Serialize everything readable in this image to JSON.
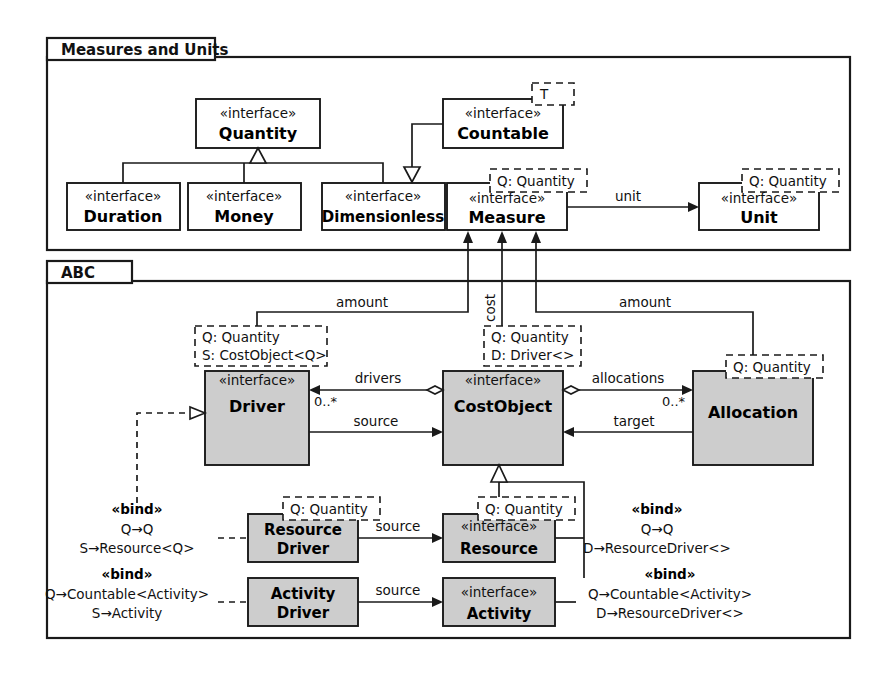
{
  "diagram": {
    "stereotype_interface": "«interface»",
    "stereotype_bind": "«bind»"
  },
  "packages": [
    {
      "id": "measures",
      "label": "Measures and Units"
    },
    {
      "id": "abc",
      "label": "ABC"
    }
  ],
  "classes": {
    "quantity": {
      "stereotype": "«interface»",
      "name": "Quantity",
      "filled": false,
      "template": []
    },
    "countable": {
      "stereotype": "«interface»",
      "name": "Countable",
      "filled": false,
      "template": [
        "T"
      ]
    },
    "duration": {
      "stereotype": "«interface»",
      "name": "Duration",
      "filled": false,
      "template": []
    },
    "money": {
      "stereotype": "«interface»",
      "name": "Money",
      "filled": false,
      "template": []
    },
    "dimensionless": {
      "stereotype": "«interface»",
      "name": "Dimensionless",
      "filled": false,
      "template": []
    },
    "measure": {
      "stereotype": "«interface»",
      "name": "Measure",
      "filled": false,
      "template": [
        "Q: Quantity"
      ]
    },
    "unit": {
      "stereotype": "«interface»",
      "name": "Unit",
      "filled": false,
      "template": [
        "Q: Quantity"
      ]
    },
    "driver": {
      "stereotype": "«interface»",
      "name": "Driver",
      "filled": true,
      "template": [
        "Q: Quantity",
        "S: CostObject<Q>"
      ]
    },
    "costobject": {
      "stereotype": "«interface»",
      "name": "CostObject",
      "filled": true,
      "template": [
        "Q: Quantity",
        "D: Driver<>"
      ]
    },
    "allocation": {
      "stereotype": "",
      "name": "Allocation",
      "filled": true,
      "template": [
        "Q: Quantity"
      ]
    },
    "resourcedriver": {
      "stereotype": "",
      "name_line1": "Resource",
      "name_line2": "Driver",
      "filled": true,
      "template": [
        "Q: Quantity"
      ]
    },
    "resource": {
      "stereotype": "«interface»",
      "name": "Resource",
      "filled": true,
      "template": [
        "Q: Quantity"
      ]
    },
    "activitydriver": {
      "stereotype": "",
      "name_line1": "Activity",
      "name_line2": "Driver",
      "filled": true,
      "template": []
    },
    "activity": {
      "stereotype": "«interface»",
      "name": "Activity",
      "filled": true,
      "template": []
    }
  },
  "edge_labels": {
    "unit": "unit",
    "amount_driver": "amount",
    "cost": "cost",
    "amount_allocation": "amount",
    "drivers": "drivers",
    "source_driver": "source",
    "allocations": "allocations",
    "target": "target",
    "source_resource": "source",
    "source_activity": "source"
  },
  "multiplicities": {
    "drivers": "0..*",
    "allocations": "0..*"
  },
  "bindings": [
    {
      "id": "bind-resourcedriver",
      "title": "«bind»",
      "lines": [
        "Q→Q",
        "S→Resource<Q>"
      ]
    },
    {
      "id": "bind-activitydriver",
      "title": "«bind»",
      "lines": [
        "Q→Countable<Activity>",
        "S→Activity"
      ]
    },
    {
      "id": "bind-resource",
      "title": "«bind»",
      "lines": [
        "Q→Q",
        "D→ResourceDriver<>"
      ]
    },
    {
      "id": "bind-activity",
      "title": "«bind»",
      "lines": [
        "Q→Countable<Activity>",
        "D→ResourceDriver<>"
      ]
    }
  ],
  "colors": {
    "line": "#1a1a1a",
    "class_fill": "#cdcdcd",
    "background": "#ffffff"
  }
}
